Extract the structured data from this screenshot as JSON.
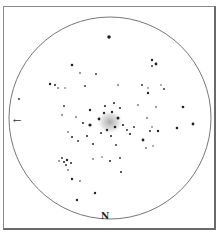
{
  "diagram": {
    "type": "star-field-finder-chart",
    "direction_label": "N",
    "arrow_icon": "left-arrow-icon",
    "arrow_glyph": "←",
    "circle": {
      "cx": 110,
      "cy": 118,
      "r": 101,
      "stroke": "#777777"
    },
    "cluster": {
      "cx": 110,
      "cy": 122,
      "rx": 14,
      "ry": 13,
      "color": "#bdbdbd"
    },
    "stars": [
      [
        109,
        37,
        1.8
      ],
      [
        152,
        60,
        1.2
      ],
      [
        156,
        64,
        1.4
      ],
      [
        152,
        66,
        0.9
      ],
      [
        72,
        65,
        1.3
      ],
      [
        80,
        73,
        0.8
      ],
      [
        96,
        74,
        0.9
      ],
      [
        50,
        84,
        1.2
      ],
      [
        55,
        85,
        1.0
      ],
      [
        58,
        88,
        0.8
      ],
      [
        65,
        88,
        0.7
      ],
      [
        85,
        86,
        0.9
      ],
      [
        118,
        85,
        0.8
      ],
      [
        142,
        85,
        0.9
      ],
      [
        148,
        88,
        0.7
      ],
      [
        161,
        85,
        0.7
      ],
      [
        164,
        89,
        0.9
      ],
      [
        148,
        93,
        1.2
      ],
      [
        19,
        99,
        0.9
      ],
      [
        114,
        103,
        1.0
      ],
      [
        138,
        105,
        0.8
      ],
      [
        156,
        107,
        0.8
      ],
      [
        183,
        107,
        1.3
      ],
      [
        64,
        106,
        0.9
      ],
      [
        90,
        110,
        1.2
      ],
      [
        105,
        106,
        1.1
      ],
      [
        120,
        108,
        1.0
      ],
      [
        62,
        115,
        0.8
      ],
      [
        76,
        117,
        0.8
      ],
      [
        83,
        123,
        1.0
      ],
      [
        90,
        125,
        1.6
      ],
      [
        99,
        119,
        1.4
      ],
      [
        104,
        113,
        1.2
      ],
      [
        112,
        112,
        1.2
      ],
      [
        118,
        118,
        1.5
      ],
      [
        115,
        127,
        1.3
      ],
      [
        107,
        130,
        1.2
      ],
      [
        101,
        133,
        1.0
      ],
      [
        123,
        125,
        1.1
      ],
      [
        127,
        130,
        0.9
      ],
      [
        130,
        134,
        1.1
      ],
      [
        134,
        127,
        0.9
      ],
      [
        147,
        118,
        0.8
      ],
      [
        111,
        136,
        1.0
      ],
      [
        150,
        131,
        1.0
      ],
      [
        152,
        127,
        0.7
      ],
      [
        158,
        131,
        1.2
      ],
      [
        177,
        128,
        1.3
      ],
      [
        193,
        124,
        1.4
      ],
      [
        68,
        132,
        0.8
      ],
      [
        72,
        137,
        1.0
      ],
      [
        78,
        141,
        0.9
      ],
      [
        87,
        136,
        1.0
      ],
      [
        93,
        144,
        1.0
      ],
      [
        143,
        140,
        1.4
      ],
      [
        146,
        148,
        0.8
      ],
      [
        153,
        146,
        0.7
      ],
      [
        116,
        145,
        0.9
      ],
      [
        102,
        157,
        0.7
      ],
      [
        62,
        158,
        0.9
      ],
      [
        64,
        162,
        1.0
      ],
      [
        67,
        160,
        1.2
      ],
      [
        59,
        161,
        0.8
      ],
      [
        66,
        165,
        0.9
      ],
      [
        68,
        170,
        0.8
      ],
      [
        71,
        163,
        1.0
      ],
      [
        93,
        159,
        0.8
      ],
      [
        110,
        161,
        1.0
      ],
      [
        120,
        158,
        0.9
      ],
      [
        72,
        179,
        1.2
      ],
      [
        95,
        193,
        1.2
      ],
      [
        77,
        200,
        1.2
      ],
      [
        121,
        172,
        1.0
      ],
      [
        80,
        181,
        0.8
      ]
    ]
  }
}
